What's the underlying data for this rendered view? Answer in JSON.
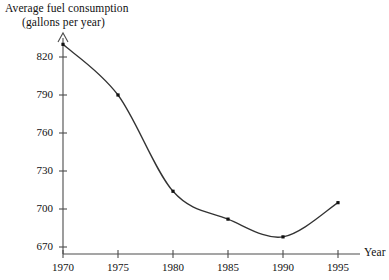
{
  "chart_data": {
    "type": "line",
    "title": "",
    "ylabel_line1": "Average fuel consumption",
    "ylabel_line2": "(gallons per year)",
    "xlabel": "Year",
    "x": [
      1970,
      1975,
      1980,
      1985,
      1990,
      1995
    ],
    "values": [
      830,
      790,
      714,
      692,
      678,
      705
    ],
    "categories": [
      "1970",
      "1975",
      "1980",
      "1985",
      "1990",
      "1995"
    ],
    "xtick_labels": [
      "1970",
      "1975",
      "1980",
      "1985",
      "1990",
      "1995"
    ],
    "ytick_labels": [
      "670",
      "700",
      "730",
      "760",
      "790",
      "820"
    ],
    "yticks": [
      670,
      700,
      730,
      760,
      790,
      820
    ],
    "ylim": [
      658,
      838
    ],
    "xlim": [
      1968.8,
      1996.6
    ],
    "grid": false,
    "legend": false,
    "markers": true,
    "series": [
      {
        "name": "Average fuel consumption",
        "values": [
          830,
          790,
          714,
          692,
          678,
          705
        ]
      }
    ]
  },
  "axes": {
    "y_title_line1": "Average fuel consumption",
    "y_title_line2": "(gallons per year)",
    "x_title": "Year"
  },
  "colors": {
    "axis": "#4c4c4c",
    "curve": "#333333",
    "marker": "#111111",
    "background": "#ffffff",
    "text": "#111111"
  }
}
